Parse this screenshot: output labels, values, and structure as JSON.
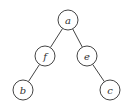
{
  "diagram": {
    "type": "binary-tree",
    "nodes": [
      {
        "id": "a",
        "label": "a",
        "x": 68,
        "y": 20
      },
      {
        "id": "f",
        "label": "f",
        "x": 45,
        "y": 56
      },
      {
        "id": "e",
        "label": "e",
        "x": 87,
        "y": 56
      },
      {
        "id": "b",
        "label": "b",
        "x": 23,
        "y": 90
      },
      {
        "id": "c",
        "label": "c",
        "x": 110,
        "y": 90
      }
    ],
    "edges": [
      {
        "from": "a",
        "to": "f"
      },
      {
        "from": "a",
        "to": "e"
      },
      {
        "from": "f",
        "to": "b"
      },
      {
        "from": "e",
        "to": "c"
      }
    ],
    "node_radius": 10
  }
}
